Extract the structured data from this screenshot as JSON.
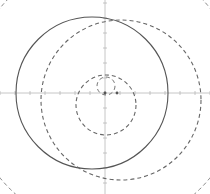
{
  "diagram": {
    "type": "geometric-circles",
    "width": 210,
    "height": 194,
    "background": "#ffffff",
    "axes": {
      "origin": [
        105,
        93
      ],
      "x_axis": {
        "y": 93,
        "from": 0,
        "to": 210,
        "color": "#b8b8b8"
      },
      "y_axis": {
        "x": 105,
        "from": 0,
        "to": 194,
        "color": "#b8b8b8"
      },
      "tick_spacing": 15,
      "tick_length": 2
    },
    "circles": [
      {
        "name": "solid-large-circle",
        "cx": 92,
        "cy": 93,
        "r": 76,
        "stroke": "#555555",
        "dashed": false,
        "width": 1.1
      },
      {
        "name": "dashed-large-circle",
        "cx": 121,
        "cy": 100,
        "r": 80,
        "stroke": "#666666",
        "dashed": true,
        "width": 1.1
      },
      {
        "name": "dashed-medium-circle",
        "cx": 106,
        "cy": 105,
        "r": 30,
        "stroke": "#666666",
        "dashed": true,
        "width": 1.1
      },
      {
        "name": "dashed-small-circle",
        "cx": 106,
        "cy": 86,
        "r": 9,
        "stroke": "#777777",
        "dashed": true,
        "width": 1
      }
    ],
    "outer_arc": {
      "name": "outer-dashed-circle",
      "cx": 105,
      "cy": 93,
      "r": 135,
      "stroke": "#888888",
      "dashed": true,
      "width": 1
    },
    "points": [
      {
        "name": "origin-point",
        "x": 105,
        "y": 93
      },
      {
        "name": "focus-point",
        "x": 117,
        "y": 93
      }
    ],
    "dash_pattern": "4 3"
  }
}
